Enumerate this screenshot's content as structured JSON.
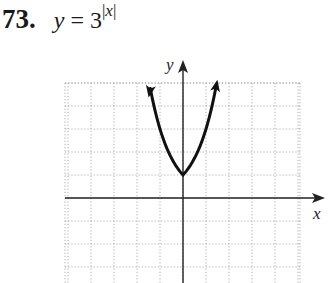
{
  "problem": {
    "number": "73.",
    "lhs": "y",
    "equals": " = ",
    "base": "3",
    "exponent": "|x|"
  },
  "graph": {
    "x_label": "x",
    "y_label": "y",
    "cell_px": 23,
    "origin_px": [
      183,
      198
    ],
    "x_range": [
      -5.1,
      5.1
    ],
    "y_range": [
      -3.7,
      5
    ],
    "grid_style": "dotted",
    "curve_color": "#111111"
  },
  "chart_data": {
    "type": "line",
    "xlabel": "x",
    "ylabel": "y",
    "function": "y = 3^|x|",
    "x": [
      -1.5,
      -1.25,
      -1,
      -0.75,
      -0.5,
      -0.25,
      0,
      0.25,
      0.5,
      0.75,
      1,
      1.25,
      1.5
    ],
    "y": [
      5.2,
      3.95,
      3,
      2.28,
      1.73,
      1.32,
      1,
      1.32,
      1.73,
      2.28,
      3,
      3.95,
      5.2
    ],
    "xlim": [
      -5,
      5
    ],
    "ylim": [
      -4,
      5
    ],
    "grid": true,
    "arrows_at_ends": true
  }
}
